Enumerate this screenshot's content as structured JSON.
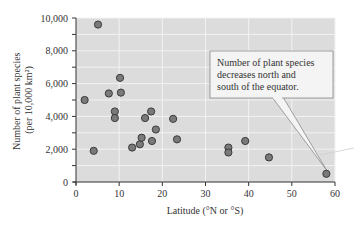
{
  "chart_data": {
    "type": "scatter",
    "title": "",
    "xlabel": "Latitude (°N or °S)",
    "ylabel": [
      "Number of plant species",
      "(per 10,000 km²)"
    ],
    "xlim": [
      0,
      60
    ],
    "ylim": [
      0,
      10000
    ],
    "xticks": [
      0,
      10,
      20,
      30,
      40,
      50,
      60
    ],
    "xtick_labels": [
      "0",
      "10",
      "20",
      "30",
      "40",
      "50",
      "60"
    ],
    "yticks": [
      0,
      2000,
      4000,
      6000,
      8000,
      10000
    ],
    "ytick_labels": [
      "0",
      "2,000",
      "4,000",
      "6,000",
      "8,000",
      "10,000"
    ],
    "grid": true,
    "legend": null,
    "points": [
      {
        "x": 2,
        "y": 5000
      },
      {
        "x": 4.1,
        "y": 1900
      },
      {
        "x": 5.1,
        "y": 9600
      },
      {
        "x": 7.6,
        "y": 5400
      },
      {
        "x": 9,
        "y": 4300
      },
      {
        "x": 9,
        "y": 3900
      },
      {
        "x": 10.2,
        "y": 6350
      },
      {
        "x": 10.4,
        "y": 5450
      },
      {
        "x": 13,
        "y": 2100
      },
      {
        "x": 14.8,
        "y": 2300
      },
      {
        "x": 15.2,
        "y": 2700
      },
      {
        "x": 16,
        "y": 3900
      },
      {
        "x": 17.4,
        "y": 4300
      },
      {
        "x": 17.6,
        "y": 2500
      },
      {
        "x": 18.5,
        "y": 3200
      },
      {
        "x": 22.5,
        "y": 3850
      },
      {
        "x": 23.4,
        "y": 2600
      },
      {
        "x": 35.3,
        "y": 2100
      },
      {
        "x": 35.3,
        "y": 1800
      },
      {
        "x": 39.2,
        "y": 2500
      },
      {
        "x": 44.7,
        "y": 1500
      },
      {
        "x": 58,
        "y": 500
      }
    ],
    "annotations": [
      {
        "text": [
          "Number of plant species",
          "decreases north and",
          "south of the equator."
        ],
        "points_to": {
          "x": 58,
          "y": 500
        }
      }
    ]
  },
  "colors": {
    "plot_bg": "#dcdcdc",
    "grid": "#f2f2f2",
    "marker_fill": "#7a7a7a",
    "marker_stroke": "#3a3a3a",
    "axis": "#333333",
    "callout_bg": "#f4f4f4",
    "callout_border": "#8a8a8a"
  }
}
